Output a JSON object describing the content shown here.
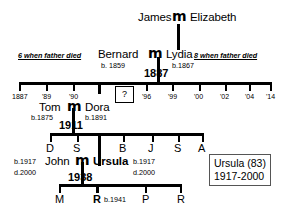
{
  "diagram": {
    "generations": {
      "g1": {
        "husband": "James",
        "marriage_symbol": "m",
        "wife": "Elizabeth"
      },
      "g2": {
        "husband": "Bernard",
        "husband_birth": "b. 1859",
        "marriage_symbol": "m",
        "wife": "Lydia",
        "wife_birth": "b.1867",
        "marriage_year": "1887",
        "left_note_num": "6",
        "left_note_text": " when father died",
        "right_note_num": "8",
        "right_note_text": " when father died"
      },
      "g3": {
        "husband": "Tom",
        "husband_birth": "b.1875",
        "marriage_symbol": "m",
        "wife": "Dora",
        "wife_birth": "b.1891",
        "marriage_year": "1911",
        "children": [
          "D",
          "S",
          "B",
          "J",
          "S",
          "A"
        ]
      },
      "g4": {
        "husband": "John",
        "husband_birth": "b.1917",
        "husband_death": "d.2000",
        "marriage_symbol": "m",
        "wife": "Ursula",
        "wife_birth": "b.1917",
        "wife_death": "d.2000",
        "marriage_year": "1938",
        "children": [
          "M",
          "R",
          "P",
          "R"
        ],
        "highlight_child_birth": "b.1941"
      }
    },
    "timeline": {
      "ticks": [
        "1887",
        "'89",
        "'90",
        "'96",
        "'99",
        "'00",
        "'02",
        "'04",
        "'14"
      ],
      "unknown_marker": "?"
    },
    "infobox": {
      "line1": "Ursula (83)",
      "line2": "1917-2000"
    },
    "colors": {
      "ink": "#000000",
      "box_border": "#555555",
      "background": "#ffffff"
    }
  }
}
